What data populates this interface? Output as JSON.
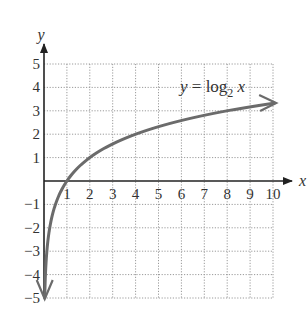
{
  "chart_data": {
    "type": "line",
    "title": "",
    "function": "log2(x)",
    "annotation": {
      "text_prefix": "y = log",
      "subscript": "2",
      "text_suffix": " x",
      "position": {
        "x": 6.9,
        "y": 4.0
      }
    },
    "xlabel": "x",
    "ylabel": "y",
    "xlim": [
      0,
      10
    ],
    "ylim": [
      -5,
      5
    ],
    "xticks": [
      1,
      2,
      3,
      4,
      5,
      6,
      7,
      8,
      9,
      10
    ],
    "yticks": [
      -5,
      -4,
      -3,
      -2,
      -1,
      1,
      2,
      3,
      4,
      5
    ],
    "xtick_labels": [
      "1",
      "2",
      "3",
      "4",
      "5",
      "6",
      "7",
      "8",
      "9",
      "10"
    ],
    "ytick_labels": [
      "−5",
      "−4",
      "−3",
      "−2",
      "−1",
      "1",
      "2",
      "3",
      "4",
      "5"
    ],
    "grid": true,
    "grid_style": "dotted",
    "series": [
      {
        "name": "y = log2 x",
        "x": [
          0.03125,
          0.0625,
          0.125,
          0.25,
          0.5,
          1,
          2,
          3,
          4,
          5,
          6,
          7,
          8,
          9,
          10
        ],
        "values": [
          -5,
          -4,
          -3,
          -2,
          -1,
          0,
          1,
          1.585,
          2,
          2.322,
          2.585,
          2.807,
          3,
          3.17,
          3.322
        ],
        "color": "#6b6b6b",
        "arrows": "both"
      }
    ],
    "colors": {
      "axis": "#222222",
      "grid": "#9a9a9a",
      "curve": "#6b6b6b"
    }
  }
}
